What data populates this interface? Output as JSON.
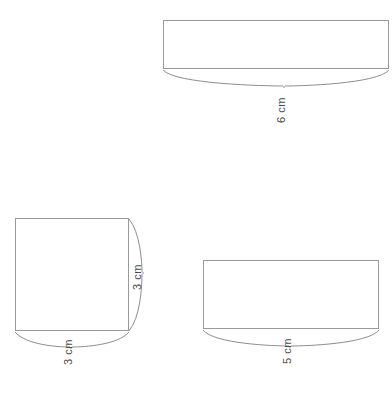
{
  "diagram": {
    "background_color": "#ffffff",
    "outline_color": "#9a9a9a",
    "brace_color": "#8e8e8e",
    "label_color": "#4a4a4a",
    "figures": [
      {
        "id": "figure-top",
        "name": "top-rectangle",
        "shape": "rectangle",
        "x": 163,
        "y": 20,
        "width": 225,
        "height": 48,
        "dimension": {
          "label": "6 cm",
          "value": 6,
          "unit": "cm",
          "side": "bottom",
          "rotation": -90
        }
      },
      {
        "id": "figure-square",
        "name": "left-square",
        "shape": "square",
        "x": 15,
        "y": 218,
        "width": 113,
        "height": 112,
        "dimensions": [
          {
            "label": "3 cm",
            "value": 3,
            "unit": "cm",
            "side": "right",
            "rotation": -90
          },
          {
            "label": "3 cm",
            "value": 3,
            "unit": "cm",
            "side": "bottom",
            "rotation": -90
          }
        ]
      },
      {
        "id": "figure-bottom-right",
        "name": "bottom-right-rectangle",
        "shape": "rectangle",
        "x": 203,
        "y": 260,
        "width": 175,
        "height": 68,
        "dimension": {
          "label": "5 cm",
          "value": 5,
          "unit": "cm",
          "side": "bottom",
          "rotation": -90
        }
      }
    ],
    "labels": {
      "top_width": "6 cm",
      "square_height": "3 cm",
      "square_width": "3 cm",
      "bottom_right_width": "5 cm"
    }
  }
}
